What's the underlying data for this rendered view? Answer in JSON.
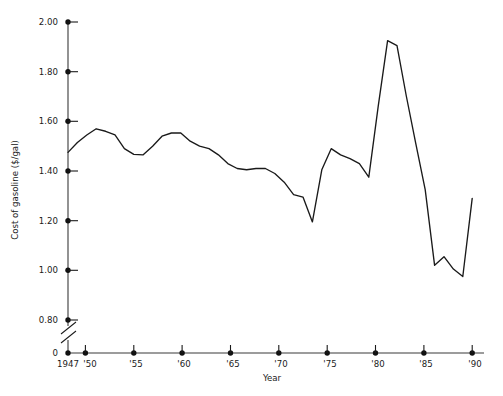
{
  "chart_data": {
    "type": "line",
    "title": "",
    "xlabel": "Year",
    "ylabel": "Cost of gasoline ($/gal)",
    "xlim": [
      1947,
      1990
    ],
    "ylim": [
      0.8,
      2.0
    ],
    "y_axis_break": true,
    "y_axis_break_note": "axis broken between 0 and 0.80",
    "grid": false,
    "legend": false,
    "x_tick_labels": [
      "1947",
      "'50",
      "'55",
      "'60",
      "'65",
      "'70",
      "'75",
      "'80",
      "'85",
      "'90"
    ],
    "x_tick_values": [
      1947,
      1950,
      1955,
      1960,
      1965,
      1970,
      1975,
      1980,
      1985,
      1990
    ],
    "y_tick_labels": [
      "0",
      "0.80",
      "1.00",
      "1.20",
      "1.40",
      "1.60",
      "1.80",
      "2.00"
    ],
    "y_tick_values": [
      0,
      0.8,
      1.0,
      1.2,
      1.4,
      1.6,
      1.8,
      2.0
    ],
    "x": [
      1947,
      1948,
      1949,
      1950,
      1951,
      1952,
      1953,
      1954,
      1955,
      1956,
      1957,
      1958,
      1959,
      1960,
      1961,
      1962,
      1963,
      1964,
      1965,
      1966,
      1967,
      1968,
      1969,
      1970,
      1971,
      1972,
      1973,
      1974,
      1975,
      1976,
      1977,
      1978,
      1979,
      1980,
      1981,
      1982,
      1983,
      1984,
      1985,
      1986,
      1987,
      1988,
      1989,
      1990
    ],
    "values": [
      1.475,
      1.515,
      1.545,
      1.57,
      1.56,
      1.545,
      1.49,
      1.467,
      1.465,
      1.5,
      1.54,
      1.553,
      1.553,
      1.52,
      1.5,
      1.49,
      1.465,
      1.43,
      1.41,
      1.405,
      1.41,
      1.41,
      1.39,
      1.355,
      1.305,
      1.295,
      1.195,
      1.405,
      1.49,
      1.465,
      1.45,
      1.43,
      1.375,
      1.66,
      1.925,
      1.905,
      1.7,
      1.51,
      1.325,
      1.02,
      1.055,
      1.005,
      0.975,
      1.29
    ],
    "series_name": "Cost of gasoline",
    "line_color": "#1a1a1a",
    "axis_color": "#3a3a3a"
  },
  "axes": {
    "ylabel": "Cost of gasoline ($/gal)",
    "xlabel": "Year"
  }
}
